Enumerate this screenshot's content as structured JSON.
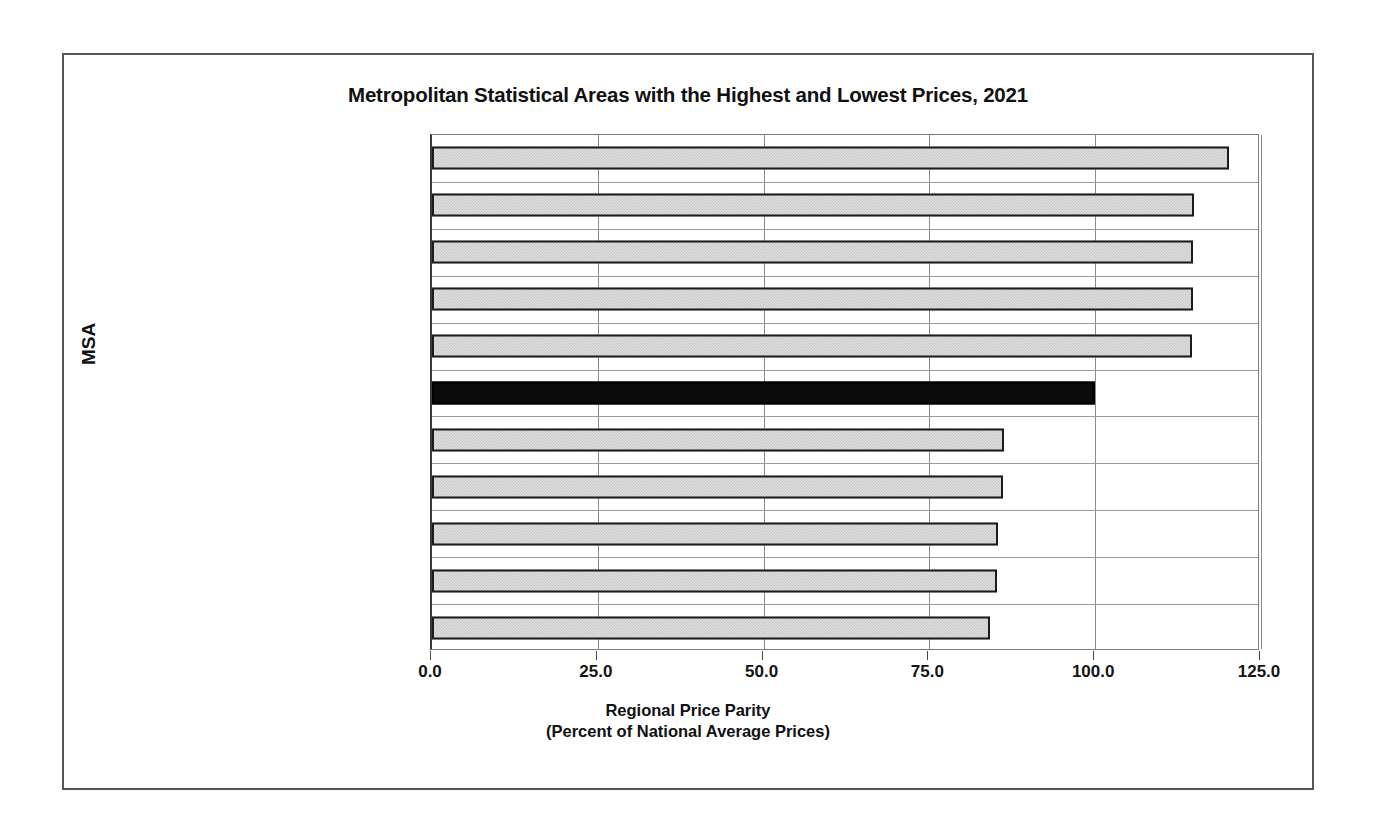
{
  "chart_data": {
    "type": "bar",
    "orientation": "horizontal",
    "title": "Metropolitan Statistical Areas with the Highest and Lowest Prices, 2021",
    "xlabel": "Regional Price Parity",
    "xlabel_line2": "(Percent of National Average Prices)",
    "ylabel": "MSA",
    "xlim": [
      0,
      125
    ],
    "xticks": [
      0,
      25,
      50,
      75,
      100,
      125
    ],
    "xtick_labels": [
      "0.0",
      "25.0",
      "50.0",
      "75.0",
      "100.0",
      "125.0"
    ],
    "grid": true,
    "legend": null,
    "categories": [
      "San Francisco-Oakland-Berkeley, CA",
      "San Diego-Chula Vista-Carlsbad, CA",
      "Urban Honolulu, HI",
      "New York-Newark-Jersey City, NY-NJ-PA",
      "Seattle-Tacoma-Bellevue, WA",
      "United States",
      "Florence-Muscle Shoals, AL",
      "Jackson, TN",
      "Morristown, TN",
      "Gadsden, AL",
      "Anniston-Oxford, AL"
    ],
    "values": [
      120.2,
      114.9,
      114.8,
      114.7,
      114.6,
      100.0,
      86.2,
      86.1,
      85.3,
      85.2,
      84.1
    ],
    "highlight_index": 5,
    "colors": {
      "bar_fill": "#c9c9c9",
      "bar_edge": "#1c1c1c",
      "highlight_fill": "#0b0b0b",
      "grid": "#8a8a8a",
      "axis": "#3c3c3c",
      "frame": "#555555",
      "text": "#1a1a1a"
    }
  }
}
